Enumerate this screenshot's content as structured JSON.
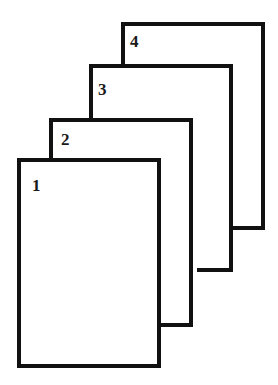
{
  "diagram": {
    "type": "stacked-pages",
    "stroke_color": "#111111",
    "background": "#ffffff",
    "pages": [
      {
        "label": "1"
      },
      {
        "label": "2"
      },
      {
        "label": "3"
      },
      {
        "label": "4"
      }
    ]
  }
}
